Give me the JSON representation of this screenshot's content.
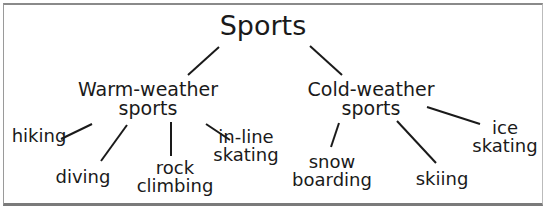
{
  "diagram": {
    "type": "tree",
    "root": {
      "label": "Sports"
    },
    "branches": [
      {
        "label_lines": [
          "Warm-weather",
          "sports"
        ],
        "children": [
          {
            "label_lines": [
              "hiking"
            ]
          },
          {
            "label_lines": [
              "diving"
            ]
          },
          {
            "label_lines": [
              "rock",
              "climbing"
            ]
          },
          {
            "label_lines": [
              "in-line",
              "skating"
            ]
          }
        ]
      },
      {
        "label_lines": [
          "Cold-weather",
          "sports"
        ],
        "children": [
          {
            "label_lines": [
              "snow",
              "boarding"
            ]
          },
          {
            "label_lines": [
              "skiing"
            ]
          },
          {
            "label_lines": [
              "ice",
              "skating"
            ]
          }
        ]
      }
    ],
    "colors": {
      "text": "#1a1a1a",
      "lines": "#1a1a1a",
      "background": "#ffffff",
      "border": "#8a8a8a"
    }
  }
}
